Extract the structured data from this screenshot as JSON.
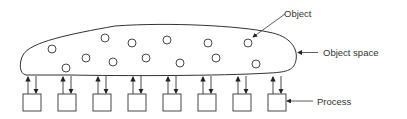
{
  "diagram": {
    "labels": {
      "object": "Object",
      "object_space": "Object space",
      "process": "Process"
    },
    "objects": [
      {
        "x": 52,
        "y": 49
      },
      {
        "x": 66,
        "y": 68
      },
      {
        "x": 86,
        "y": 58
      },
      {
        "x": 105,
        "y": 38
      },
      {
        "x": 113,
        "y": 62
      },
      {
        "x": 132,
        "y": 43
      },
      {
        "x": 146,
        "y": 58
      },
      {
        "x": 167,
        "y": 40
      },
      {
        "x": 180,
        "y": 63
      },
      {
        "x": 208,
        "y": 43
      },
      {
        "x": 216,
        "y": 58
      },
      {
        "x": 248,
        "y": 43
      },
      {
        "x": 256,
        "y": 64
      }
    ],
    "processes": [
      {
        "x": 23
      },
      {
        "x": 58
      },
      {
        "x": 93
      },
      {
        "x": 128
      },
      {
        "x": 163
      },
      {
        "x": 198
      },
      {
        "x": 233
      },
      {
        "x": 268
      }
    ],
    "colors": {
      "stroke": "#333333",
      "background": "#ffffff"
    }
  }
}
